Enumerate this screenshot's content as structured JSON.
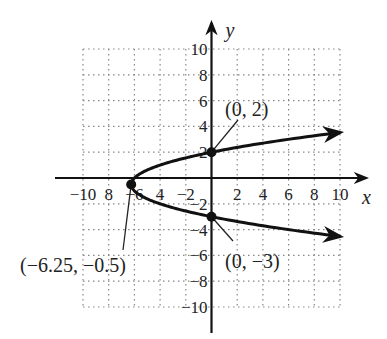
{
  "chart_data": {
    "type": "line",
    "title": "",
    "xlabel": "x",
    "ylabel": "y",
    "xlim": [
      -10,
      10
    ],
    "ylim": [
      -10,
      10
    ],
    "grid": true,
    "x_ticks": [
      -10,
      -8,
      -6,
      -4,
      -2,
      2,
      4,
      6,
      8,
      10
    ],
    "y_ticks": [
      10,
      8,
      6,
      4,
      2,
      -2,
      -4,
      -6,
      -8,
      -10
    ],
    "x_tick_labels": [
      "−10",
      "8",
      "−6",
      "4",
      "−2",
      "2",
      "4",
      "6",
      "8",
      "10"
    ],
    "y_tick_labels": [
      "10",
      "8",
      "6",
      "4",
      "2",
      "−2",
      "−4",
      "−6",
      "−8",
      "−10"
    ],
    "series": [
      {
        "name": "x = y^2 + y - 6",
        "equation": "x = (y + 0.5)^2 - 6.25",
        "y_range": [
          -4.53,
          3.53
        ],
        "color": "#111111"
      }
    ],
    "points": [
      {
        "x": 0,
        "y": 2,
        "label": "(0, 2)"
      },
      {
        "x": 0,
        "y": -3,
        "label": "(0, −3)"
      },
      {
        "x": -6.25,
        "y": -0.5,
        "label": "(−6.25, −0.5)"
      }
    ]
  }
}
